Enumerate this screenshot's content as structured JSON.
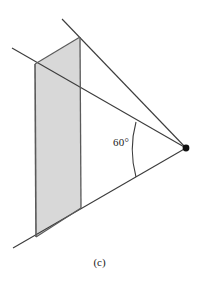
{
  "figure": {
    "caption": "(c)",
    "angle_label": "60°",
    "angle_value": 60,
    "angle_unit": "degrees",
    "colors": {
      "stroke": "#3c3c3c",
      "plane_fill": "#d8d8d8",
      "plane_stroke": "#4a4a4a",
      "vertex_dot": "#111111",
      "background": "#ffffff",
      "text": "#1a1a1a"
    },
    "geometry": {
      "apex_point": [
        186,
        148
      ],
      "apex_dot_radius": 3.4,
      "plane_quad": [
        [
          35,
          64
        ],
        [
          80,
          37
        ],
        [
          81,
          208
        ],
        [
          36,
          237
        ]
      ],
      "upper_ray": [
        [
          62,
          19
        ],
        [
          186,
          148
        ]
      ],
      "lower_ray": [
        [
          13,
          248
        ],
        [
          186,
          148
        ]
      ],
      "mid_ray": [
        [
          12,
          48
        ],
        [
          186,
          148
        ]
      ],
      "angle_arc": {
        "start": [
          136,
          122
        ],
        "end": [
          136,
          177
        ],
        "bulge_x": 130,
        "radius": 58
      }
    }
  }
}
